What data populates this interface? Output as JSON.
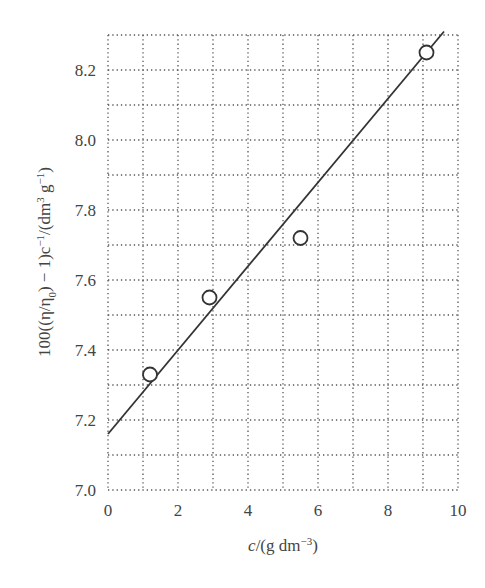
{
  "chart_data": {
    "type": "scatter",
    "title": "",
    "xlabel": "c/(g dm^-3)",
    "ylabel": "100((η/η0) − 1)c^-1/(dm^3 g^-1)",
    "xlim": [
      0,
      10
    ],
    "ylim": [
      7.0,
      8.3
    ],
    "grid": true,
    "grid_style": "dotted",
    "x_ticks": [
      "0",
      "2",
      "4",
      "6",
      "8",
      "10"
    ],
    "y_ticks": [
      "7.0",
      "7.2",
      "7.4",
      "7.6",
      "7.8",
      "8.0",
      "8.2"
    ],
    "series": [
      {
        "name": "data",
        "marker": "open-circle",
        "x": [
          1.2,
          2.9,
          5.5,
          9.1
        ],
        "y": [
          7.33,
          7.55,
          7.72,
          8.25
        ]
      },
      {
        "name": "fit",
        "style": "line",
        "x": [
          0,
          9.6
        ],
        "y": [
          7.16,
          8.31
        ],
        "intercept": 7.16,
        "slope": 0.12
      }
    ],
    "legend": null
  },
  "labels": {
    "x_axis_main": "c",
    "x_axis_rest": "/(g dm",
    "x_axis_sup": "−3",
    "x_axis_close": ")",
    "y_axis_part1": "100((η/η",
    "y_axis_sub": "0",
    "y_axis_part2": ") − 1)c",
    "y_axis_sup1": "−1",
    "y_axis_part3": "/(dm",
    "y_axis_sup2": "3",
    "y_axis_part4": " g",
    "y_axis_sup3": "−1",
    "y_axis_part5": ")"
  },
  "colors": {
    "line": "#333333",
    "grid": "#555555",
    "marker": "#333333"
  }
}
